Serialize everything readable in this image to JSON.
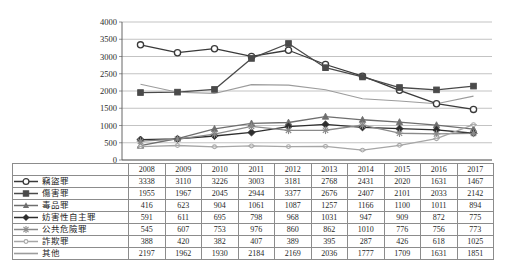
{
  "chart_data": {
    "type": "line",
    "title": "",
    "xlabel": "",
    "ylabel": "",
    "ylim": [
      0,
      4000
    ],
    "ytick_step": 500,
    "yticks": [
      0,
      500,
      1000,
      1500,
      2000,
      2500,
      3000,
      3500,
      4000
    ],
    "grid": true,
    "legend_position": "table-left",
    "categories": [
      "2008",
      "2009",
      "2010",
      "2011",
      "2012",
      "2013",
      "2014",
      "2015",
      "2016",
      "2017"
    ],
    "series": [
      {
        "name": "竊盜罪",
        "marker": "open-circle",
        "color": "#3a3a3a",
        "values": [
          3338,
          3110,
          3226,
          3003,
          3181,
          2768,
          2431,
          2020,
          1631,
          1467
        ]
      },
      {
        "name": "傷害罪",
        "marker": "filled-square",
        "color": "#4a4a4a",
        "values": [
          1955,
          1967,
          2045,
          2944,
          3377,
          2676,
          2407,
          2101,
          2033,
          2142
        ]
      },
      {
        "name": "毒品罪",
        "marker": "triangle",
        "color": "#6e6e6e",
        "values": [
          416,
          623,
          904,
          1061,
          1087,
          1257,
          1166,
          1100,
          1011,
          894
        ]
      },
      {
        "name": "妨害性自主罪",
        "marker": "diamond",
        "color": "#2e2e2e",
        "values": [
          591,
          611,
          695,
          798,
          968,
          1031,
          947,
          909,
          872,
          775
        ]
      },
      {
        "name": "公共危險罪",
        "marker": "asterisk",
        "color": "#8a8a8a",
        "values": [
          545,
          607,
          753,
          976,
          860,
          862,
          1010,
          776,
          756,
          773
        ]
      },
      {
        "name": "詐欺罪",
        "marker": "small-circle",
        "color": "#a6a6a6",
        "values": [
          388,
          420,
          382,
          407,
          389,
          395,
          287,
          426,
          618,
          1025
        ]
      },
      {
        "name": "其他",
        "marker": "none",
        "color": "#9c9c9c",
        "values": [
          2197,
          1962,
          1930,
          2184,
          2169,
          2036,
          1777,
          1709,
          1631,
          1851
        ]
      }
    ]
  },
  "table": {
    "legend_header": "",
    "year_headers": [
      "2008",
      "2009",
      "2010",
      "2011",
      "2012",
      "2013",
      "2014",
      "2015",
      "2016",
      "2017"
    ],
    "rows": [
      {
        "label": "竊盜罪",
        "values": [
          "3338",
          "3110",
          "3226",
          "3003",
          "3181",
          "2768",
          "2431",
          "2020",
          "1631",
          "1467"
        ]
      },
      {
        "label": "傷害罪",
        "values": [
          "1955",
          "1967",
          "2045",
          "2944",
          "3377",
          "2676",
          "2407",
          "2101",
          "2033",
          "2142"
        ]
      },
      {
        "label": "毒品罪",
        "values": [
          "416",
          "623",
          "904",
          "1061",
          "1087",
          "1257",
          "1166",
          "1100",
          "1011",
          "894"
        ]
      },
      {
        "label": "妨害性自主罪",
        "values": [
          "591",
          "611",
          "695",
          "798",
          "968",
          "1031",
          "947",
          "909",
          "872",
          "775"
        ]
      },
      {
        "label": "公共危險罪",
        "values": [
          "545",
          "607",
          "753",
          "976",
          "860",
          "862",
          "1010",
          "776",
          "756",
          "773"
        ]
      },
      {
        "label": "詐欺罪",
        "values": [
          "388",
          "420",
          "382",
          "407",
          "389",
          "395",
          "287",
          "426",
          "618",
          "1025"
        ]
      },
      {
        "label": "其他",
        "values": [
          "2197",
          "1962",
          "1930",
          "2184",
          "2169",
          "2036",
          "1777",
          "1709",
          "1631",
          "1851"
        ]
      }
    ]
  },
  "colors": {
    "grid": "#b4b4b4",
    "axis": "#7a7a7a",
    "table_border": "#8c8c8c",
    "text": "#1f1f1f"
  }
}
